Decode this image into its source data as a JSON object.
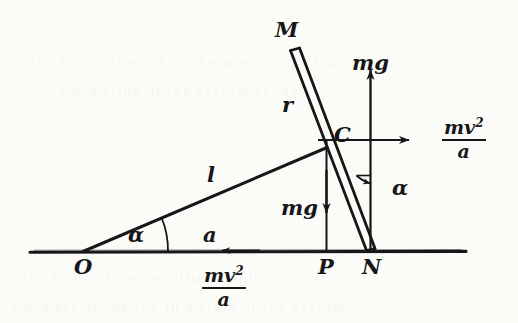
{
  "figure": {
    "ink_color": "#17171a",
    "background_color": "#fbfbf8"
  },
  "points": {
    "M": "M",
    "C": "C",
    "O": "O",
    "P": "P",
    "N": "N"
  },
  "segments": {
    "r": "r",
    "l": "l"
  },
  "angles": {
    "at_O": "α",
    "at_N": "α"
  },
  "forces": {
    "mg_up": "mg",
    "mg_down": "mg",
    "horizontal_accel": "a",
    "centrifugal_right_num": "mv",
    "centrifugal_right_exp": "2",
    "centrifugal_right_den": "a",
    "centrifugal_bottom_num": "mv",
    "centrifugal_bottom_exp": "2",
    "centrifugal_bottom_den": "a"
  },
  "geometry": {
    "baseline_y": 252,
    "baseline_x_start": 30,
    "baseline_x_end": 466,
    "O": [
      82,
      252
    ],
    "P": [
      326,
      252
    ],
    "N": [
      370,
      252
    ],
    "C": [
      326,
      140
    ],
    "rod_top": [
      293,
      50
    ],
    "rod_bottom": [
      371,
      251
    ],
    "l_start": [
      82,
      252
    ],
    "l_end": [
      326,
      148
    ]
  }
}
